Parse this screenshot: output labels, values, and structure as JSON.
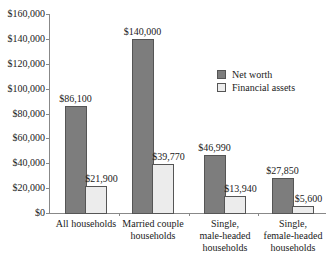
{
  "chart_data": {
    "type": "bar",
    "title": "",
    "xlabel": "",
    "ylabel": "",
    "ylim": [
      0,
      160000
    ],
    "yticks": [
      "$0",
      "$20,000",
      "$40,000",
      "$60,000",
      "$80,000",
      "$100,000",
      "$120,000",
      "$140,000",
      "$160,000"
    ],
    "categories": [
      "All households",
      "Married couple households",
      "Single, male-headed households",
      "Single, female-headed households"
    ],
    "category_lines": [
      [
        "All households"
      ],
      [
        "Married couple",
        "households"
      ],
      [
        "Single,",
        "male-headed",
        "households"
      ],
      [
        "Single,",
        "female-headed",
        "households"
      ]
    ],
    "series": [
      {
        "name": "Net worth",
        "color": "#7d7d7d",
        "values": [
          86100,
          140000,
          46990,
          27850
        ],
        "labels": [
          "$86,100",
          "$140,000",
          "$46,990",
          "$27,850"
        ]
      },
      {
        "name": "Financial assets",
        "color": "#ececec",
        "values": [
          21900,
          39770,
          13940,
          5600
        ],
        "labels": [
          "$21,900",
          "$39,770",
          "$13,940",
          "$5,600"
        ]
      }
    ],
    "legend_position": "right",
    "grid": false
  }
}
